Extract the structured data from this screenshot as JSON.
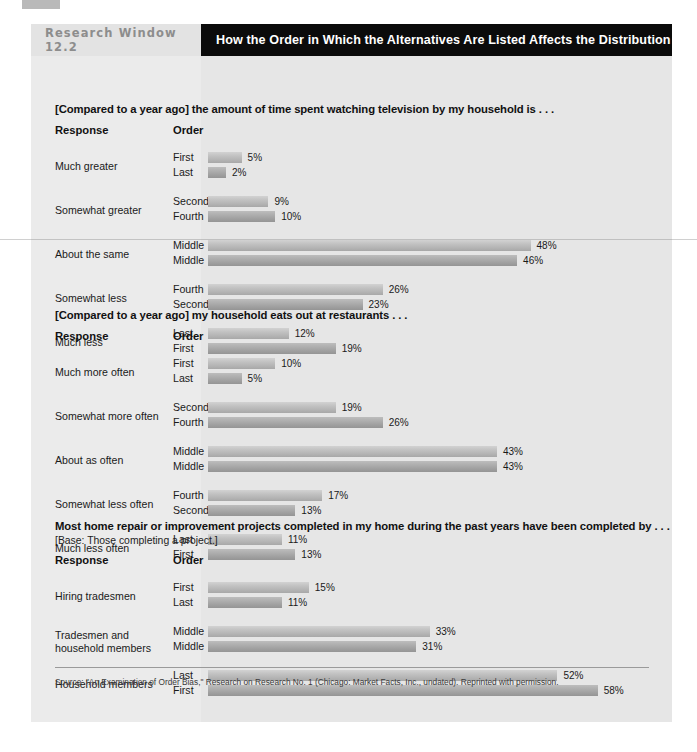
{
  "header": {
    "kicker": "Research Window 12.2",
    "title": "How the Order in Which the Alternatives Are Listed Affects the Distribution of Replies"
  },
  "columns": {
    "response": "Response",
    "order": "Order"
  },
  "source": "Source: \"An Examination of Order Bias,\" Research on Research No. 1 (Chicago: Market Facts, Inc., undated). Reprinted with permission.",
  "sections": [
    {
      "question": "[Compared to a year ago] the amount of time spent watching television by my household is . . .",
      "subnote": "",
      "rows": [
        {
          "response": "Much greater",
          "pairs": [
            {
              "order": "First",
              "value": 5,
              "label": "5%"
            },
            {
              "order": "Last",
              "value": 2,
              "label": "2%"
            }
          ]
        },
        {
          "response": "Somewhat greater",
          "pairs": [
            {
              "order": "Second",
              "value": 9,
              "label": "9%"
            },
            {
              "order": "Fourth",
              "value": 10,
              "label": "10%"
            }
          ]
        },
        {
          "response": "About the same",
          "pairs": [
            {
              "order": "Middle",
              "value": 48,
              "label": "48%"
            },
            {
              "order": "Middle",
              "value": 46,
              "label": "46%"
            }
          ]
        },
        {
          "response": "Somewhat less",
          "pairs": [
            {
              "order": "Fourth",
              "value": 26,
              "label": "26%"
            },
            {
              "order": "Second",
              "value": 23,
              "label": "23%"
            }
          ]
        },
        {
          "response": "Much less",
          "pairs": [
            {
              "order": "Last",
              "value": 12,
              "label": "12%"
            },
            {
              "order": "First",
              "value": 19,
              "label": "19%"
            }
          ]
        }
      ]
    },
    {
      "question": "[Compared to a year ago] my household eats out at restaurants . . .",
      "subnote": "",
      "rows": [
        {
          "response": "Much more often",
          "pairs": [
            {
              "order": "First",
              "value": 10,
              "label": "10%"
            },
            {
              "order": "Last",
              "value": 5,
              "label": "5%"
            }
          ]
        },
        {
          "response": "Somewhat more often",
          "pairs": [
            {
              "order": "Second",
              "value": 19,
              "label": "19%"
            },
            {
              "order": "Fourth",
              "value": 26,
              "label": "26%"
            }
          ]
        },
        {
          "response": "About as often",
          "pairs": [
            {
              "order": "Middle",
              "value": 43,
              "label": "43%"
            },
            {
              "order": "Middle",
              "value": 43,
              "label": "43%"
            }
          ]
        },
        {
          "response": "Somewhat less often",
          "pairs": [
            {
              "order": "Fourth",
              "value": 17,
              "label": "17%"
            },
            {
              "order": "Second",
              "value": 13,
              "label": "13%"
            }
          ]
        },
        {
          "response": "Much less often",
          "pairs": [
            {
              "order": "Last",
              "value": 11,
              "label": "11%"
            },
            {
              "order": "First",
              "value": 13,
              "label": "13%"
            }
          ]
        }
      ]
    },
    {
      "question": "Most home repair or improvement projects completed in my home during the past years have been completed by . . .",
      "subnote": "[Base: Those completing a project.]",
      "rows": [
        {
          "response": "Hiring tradesmen",
          "pairs": [
            {
              "order": "First",
              "value": 15,
              "label": "15%"
            },
            {
              "order": "Last",
              "value": 11,
              "label": "11%"
            }
          ]
        },
        {
          "response": "Tradesmen and\nhousehold members",
          "pairs": [
            {
              "order": "Middle",
              "value": 33,
              "label": "33%"
            },
            {
              "order": "Middle",
              "value": 31,
              "label": "31%"
            }
          ]
        },
        {
          "response": "Household members",
          "pairs": [
            {
              "order": "Last",
              "value": 52,
              "label": "52%"
            },
            {
              "order": "First",
              "value": 58,
              "label": "58%"
            }
          ]
        }
      ]
    }
  ],
  "chart_data": {
    "type": "bar",
    "title": "How the Order in Which the Alternatives Are Listed Affects the Distribution of Replies",
    "xlabel": "Percent of replies",
    "ylabel": "Response / Order",
    "xlim": [
      0,
      60
    ],
    "grid": false,
    "legend": null,
    "panels": [
      {
        "title": "[Compared to a year ago] the amount of time spent watching television by my household is . . .",
        "categories": [
          "Much greater",
          "Somewhat greater",
          "About the same",
          "Somewhat less",
          "Much less"
        ],
        "series": [
          {
            "name": "Order A (First, Second, Middle, Fourth, Last)",
            "orders": [
              "First",
              "Second",
              "Middle",
              "Fourth",
              "Last"
            ],
            "values": [
              5,
              9,
              48,
              26,
              12
            ]
          },
          {
            "name": "Order B (Last, Fourth, Middle, Second, First)",
            "orders": [
              "Last",
              "Fourth",
              "Middle",
              "Second",
              "First"
            ],
            "values": [
              2,
              10,
              46,
              23,
              19
            ]
          }
        ]
      },
      {
        "title": "[Compared to a year ago] my household eats out at restaurants . . .",
        "categories": [
          "Much more often",
          "Somewhat more often",
          "About as often",
          "Somewhat less often",
          "Much less often"
        ],
        "series": [
          {
            "name": "Order A (First, Second, Middle, Fourth, Last)",
            "orders": [
              "First",
              "Second",
              "Middle",
              "Fourth",
              "Last"
            ],
            "values": [
              10,
              19,
              43,
              17,
              11
            ]
          },
          {
            "name": "Order B (Last, Fourth, Middle, Second, First)",
            "orders": [
              "Last",
              "Fourth",
              "Middle",
              "Second",
              "First"
            ],
            "values": [
              5,
              26,
              43,
              13,
              13
            ]
          }
        ]
      },
      {
        "title": "Most home repair or improvement projects completed in my home during the past years have been completed by . . .",
        "subtitle": "[Base: Those completing a project.]",
        "categories": [
          "Hiring tradesmen",
          "Tradesmen and household members",
          "Household members"
        ],
        "series": [
          {
            "name": "Order A (First, Middle, Last)",
            "orders": [
              "First",
              "Middle",
              "Last"
            ],
            "values": [
              15,
              33,
              52
            ]
          },
          {
            "name": "Order B (Last, Middle, First)",
            "orders": [
              "Last",
              "Middle",
              "First"
            ],
            "values": [
              11,
              31,
              58
            ]
          }
        ]
      }
    ]
  }
}
